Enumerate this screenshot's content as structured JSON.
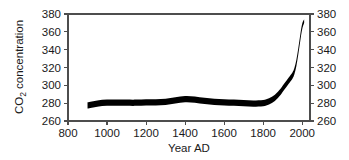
{
  "figure": {
    "name": "co2-concentration-chart",
    "background_color": "#ffffff",
    "line_color": "#000000",
    "axis_color": "#4d4d4d",
    "text_color": "#1a1a1a"
  },
  "chart_data": {
    "type": "line",
    "title": "",
    "subtitle": "",
    "xlabel": "Year AD",
    "ylabel": "CO2 concentration",
    "ylabel_display": "CO₂ concentration",
    "ylabel_base": "CO",
    "ylabel_subscript": "2",
    "ylabel_rest": " concentration",
    "xlim": [
      800,
      2040
    ],
    "ylim": [
      260,
      380
    ],
    "xticks": [
      800,
      1000,
      1200,
      1400,
      1600,
      1800,
      2000
    ],
    "xtick_labels": [
      "800",
      "1000",
      "1200",
      "1400",
      "1600",
      "1800",
      "2000"
    ],
    "yticks": [
      260,
      280,
      300,
      320,
      340,
      360,
      380
    ],
    "ytick_labels": [
      "260",
      "280",
      "300",
      "320",
      "340",
      "360",
      "380"
    ],
    "grid": false,
    "legend": null,
    "legend_position": "none",
    "right_axis": {
      "visible": true,
      "yticks": [
        260,
        280,
        300,
        320,
        340,
        360,
        380
      ],
      "ytick_labels": [
        "260",
        "280",
        "300",
        "320",
        "340",
        "360",
        "380"
      ]
    },
    "band_width_ppm": 7,
    "series": [
      {
        "name": "CO2 concentration band",
        "style": "thick-band",
        "color": "#000000",
        "x": [
          900,
          950,
          1000,
          1050,
          1100,
          1150,
          1200,
          1250,
          1300,
          1350,
          1400,
          1450,
          1500,
          1550,
          1600,
          1650,
          1700,
          1750,
          1800,
          1830,
          1860,
          1890,
          1910,
          1930,
          1950,
          1960,
          1970,
          1980,
          1990,
          2000,
          2010
        ],
        "values": [
          277.5,
          279.5,
          280.5,
          280.5,
          280.5,
          280.5,
          281.0,
          281.0,
          281.5,
          283.0,
          284.5,
          284.0,
          282.5,
          281.5,
          281.0,
          280.5,
          280.0,
          279.5,
          280.0,
          282.0,
          286.0,
          293.0,
          299.0,
          305.0,
          311.0,
          316.0,
          325.0,
          338.0,
          353.0,
          366.0,
          372.0
        ],
        "upper": [
          281.0,
          283.0,
          284.0,
          284.0,
          284.0,
          284.0,
          284.5,
          284.5,
          285.0,
          286.5,
          288.0,
          287.5,
          286.0,
          285.0,
          284.5,
          284.0,
          283.5,
          283.0,
          283.5,
          285.5,
          289.5,
          296.5,
          302.5,
          308.5,
          314.5,
          319.5,
          328.5,
          341.5,
          356.5,
          369.0,
          374.0
        ],
        "lower": [
          274.0,
          276.0,
          277.0,
          277.0,
          277.0,
          277.0,
          277.5,
          277.5,
          278.0,
          279.5,
          281.0,
          280.5,
          279.0,
          278.0,
          277.5,
          277.0,
          276.5,
          276.0,
          276.5,
          278.5,
          282.5,
          289.5,
          295.5,
          301.5,
          307.5,
          312.5,
          321.5,
          334.5,
          349.5,
          363.0,
          370.0
        ]
      }
    ],
    "annotations": []
  }
}
